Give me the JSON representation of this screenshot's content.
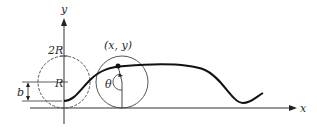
{
  "diagram": {
    "type": "rolling-circle-curve",
    "labels": {
      "y_axis": "y",
      "x_axis": "x",
      "two_r": "2R",
      "r": "R",
      "b": "b",
      "point": "(x, y)",
      "theta": "θ"
    },
    "colors": {
      "ink": "#222222",
      "background": "#ffffff"
    }
  }
}
